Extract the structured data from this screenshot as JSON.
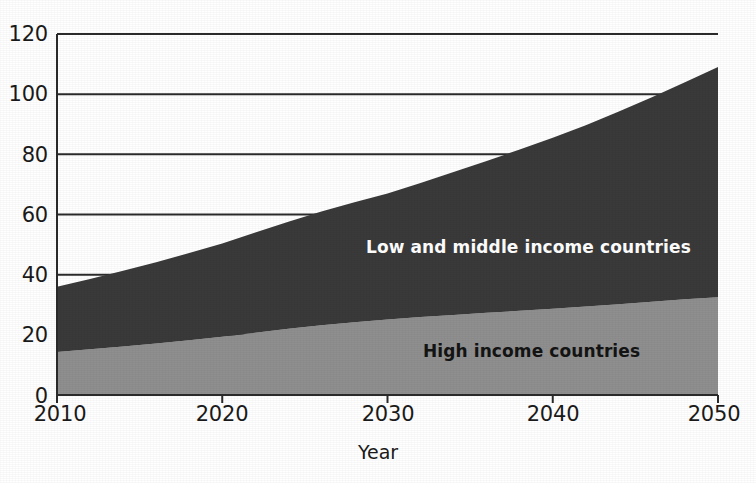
{
  "chart_data": {
    "type": "area",
    "stacked": true,
    "title": "",
    "subtitle": "",
    "xlabel": "Year",
    "ylabel": "",
    "x": [
      2010,
      2012,
      2014,
      2016,
      2018,
      2020,
      2022,
      2024,
      2026,
      2028,
      2030,
      2032,
      2034,
      2036,
      2038,
      2040,
      2042,
      2044,
      2046,
      2048,
      2050
    ],
    "xlim": [
      2010,
      2050
    ],
    "ylim": [
      0,
      120
    ],
    "xticks": [
      "2010",
      "2020",
      "2030",
      "2040",
      "2050"
    ],
    "xtick_values": [
      2010,
      2020,
      2030,
      2040,
      2050
    ],
    "yticks": [
      "0",
      "20",
      "40",
      "60",
      "80",
      "100",
      "120"
    ],
    "ytick_values": [
      0,
      20,
      40,
      60,
      80,
      100,
      120
    ],
    "grid": "horizontal",
    "legend_position": "in-plot",
    "series": [
      {
        "name": "High income countries",
        "color": "#8f8f8f",
        "label_color": "#141414",
        "values": [
          14.3,
          15.2,
          16.1,
          17.1,
          18.2,
          19.4,
          20.7,
          22.0,
          23.2,
          24.2,
          25.1,
          25.9,
          26.6,
          27.3,
          28.0,
          28.7,
          29.4,
          30.2,
          31.0,
          31.8,
          32.5
        ]
      },
      {
        "name": "Low and middle income countries",
        "color": "#3a3a3a",
        "label_color": "#ffffff",
        "values": [
          21.7,
          23.4,
          25.2,
          27.0,
          29.0,
          31.0,
          33.3,
          35.6,
          37.8,
          39.9,
          41.9,
          44.6,
          47.5,
          50.5,
          53.6,
          56.8,
          60.3,
          64.0,
          68.0,
          72.2,
          76.5
        ]
      }
    ],
    "totals": [
      36,
      38.6,
      41.3,
      44.1,
      47.2,
      50.4,
      54.0,
      57.6,
      61.0,
      64.1,
      67.0,
      70.5,
      74.1,
      77.8,
      81.6,
      85.5,
      89.7,
      94.2,
      99.0,
      104.0,
      109.0
    ],
    "annotations": [
      {
        "text": "Low and middle income countries",
        "series": "Low and middle income countries"
      },
      {
        "text": "High income countries",
        "series": "High income countries"
      }
    ]
  },
  "axes": {
    "x_title": "Year",
    "x_tick_labels": [
      "2010",
      "2020",
      "2030",
      "2040",
      "2050"
    ],
    "y_tick_labels": [
      "120",
      "100",
      "80",
      "60",
      "40",
      "20",
      "0"
    ]
  },
  "labels": {
    "low_income": "Low and middle income countries",
    "high_income": "High income countries"
  },
  "colors": {
    "low_income_area": "#3a3a3a",
    "high_income_area": "#8f8f8f",
    "gridline": "#2b2b2b",
    "axis": "#2b2b2b",
    "background": "#ffffff",
    "text": "#1a1a1a"
  }
}
